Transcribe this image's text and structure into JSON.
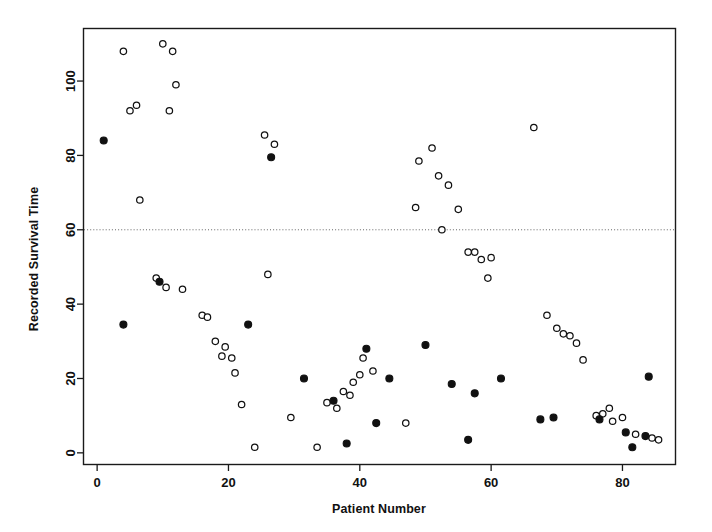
{
  "chart_data": {
    "type": "scatter",
    "title": "",
    "xlabel": "Patient Number",
    "ylabel": "Recorded Survival Time",
    "xlim": [
      -2,
      88
    ],
    "ylim": [
      -3,
      114
    ],
    "xticks": [
      0,
      20,
      40,
      60,
      80
    ],
    "yticks": [
      0,
      20,
      40,
      60,
      80,
      100
    ],
    "xtick_labels": [
      "0",
      "20",
      "40",
      "60",
      "80"
    ],
    "ytick_labels": [
      "0",
      "20",
      "40",
      "60",
      "80",
      "100"
    ],
    "grid": false,
    "legend": "none",
    "annotations": [
      {
        "kind": "horizontal-reference-line",
        "y": 60,
        "style": "dotted",
        "label": ""
      }
    ],
    "series": [
      {
        "name": "open-circle",
        "marker": "open-circle",
        "marker_color": "#ffffff",
        "marker_edge_color": "#111111",
        "points": [
          [
            4,
            108
          ],
          [
            5,
            92
          ],
          [
            6,
            93.5
          ],
          [
            6.5,
            68
          ],
          [
            10,
            110
          ],
          [
            11.5,
            108
          ],
          [
            12,
            99
          ],
          [
            11,
            92
          ],
          [
            9,
            47
          ],
          [
            10.5,
            44.5
          ],
          [
            13,
            44
          ],
          [
            16,
            37
          ],
          [
            16.8,
            36.5
          ],
          [
            18,
            30
          ],
          [
            19.5,
            28.5
          ],
          [
            19,
            26
          ],
          [
            20.5,
            25.5
          ],
          [
            21,
            21.5
          ],
          [
            22,
            13
          ],
          [
            24,
            1.5
          ],
          [
            25.5,
            85.5
          ],
          [
            27,
            83
          ],
          [
            26,
            48
          ],
          [
            29.5,
            9.5
          ],
          [
            33.5,
            1.5
          ],
          [
            35,
            13.5
          ],
          [
            36.5,
            12
          ],
          [
            37.5,
            16.5
          ],
          [
            38.5,
            15.5
          ],
          [
            39,
            19
          ],
          [
            40,
            21
          ],
          [
            40.5,
            25.5
          ],
          [
            42,
            22
          ],
          [
            47,
            8
          ],
          [
            49,
            78.5
          ],
          [
            51,
            82
          ],
          [
            48.5,
            66
          ],
          [
            52,
            74.5
          ],
          [
            53.5,
            72
          ],
          [
            52.5,
            60
          ],
          [
            55,
            65.5
          ],
          [
            56.5,
            54
          ],
          [
            57.5,
            54
          ],
          [
            58.5,
            52
          ],
          [
            60,
            52.5
          ],
          [
            59.5,
            47
          ],
          [
            66.5,
            87.5
          ],
          [
            68.5,
            37
          ],
          [
            70,
            33.5
          ],
          [
            71,
            32
          ],
          [
            72,
            31.5
          ],
          [
            73,
            29.5
          ],
          [
            74,
            25
          ],
          [
            76,
            10
          ],
          [
            77,
            10.5
          ],
          [
            78,
            12
          ],
          [
            78.5,
            8.5
          ],
          [
            80,
            9.5
          ],
          [
            82,
            5
          ],
          [
            84.5,
            4
          ],
          [
            85.5,
            3.5
          ]
        ]
      },
      {
        "name": "filled-circle",
        "marker": "filled-circle",
        "marker_color": "#111111",
        "marker_edge_color": "#111111",
        "points": [
          [
            1,
            84
          ],
          [
            4,
            34.5
          ],
          [
            9.5,
            46
          ],
          [
            23,
            34.5
          ],
          [
            26.5,
            79.5
          ],
          [
            31.5,
            20
          ],
          [
            36,
            14
          ],
          [
            38,
            2.5
          ],
          [
            41,
            28
          ],
          [
            42.5,
            8
          ],
          [
            44.5,
            20
          ],
          [
            50,
            29
          ],
          [
            54,
            18.5
          ],
          [
            56.5,
            3.5
          ],
          [
            57.5,
            16
          ],
          [
            61.5,
            20
          ],
          [
            67.5,
            9
          ],
          [
            69.5,
            9.5
          ],
          [
            76.5,
            9
          ],
          [
            80.5,
            5.5
          ],
          [
            81.5,
            1.5
          ],
          [
            83.5,
            4.5
          ],
          [
            84,
            20.5
          ]
        ]
      }
    ]
  }
}
